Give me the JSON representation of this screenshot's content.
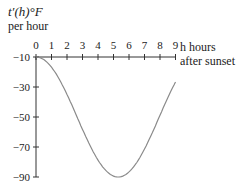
{
  "chart_data": {
    "type": "line",
    "title": "",
    "ylabel_line1": "t′(h)°F",
    "ylabel_line2": "per hour",
    "xlabel_line1": "h hours",
    "xlabel_line2": "after sunset",
    "x_ticks": [
      "0",
      "1",
      "2",
      "3",
      "4",
      "5",
      "6",
      "7",
      "8",
      "9"
    ],
    "y_ticks": [
      "−10",
      "−30",
      "−50",
      "−70",
      "−90"
    ],
    "xlim": [
      0,
      9
    ],
    "ylim": [
      -90,
      -10
    ],
    "series": [
      {
        "name": "t'(h)",
        "x": [
          0,
          1,
          2,
          3,
          4,
          5,
          5.3,
          6,
          7,
          8,
          9
        ],
        "values": [
          -10,
          -16.8,
          -35.4,
          -58.5,
          -79.2,
          -89.8,
          -90,
          -88.6,
          -77.1,
          -58.8,
          -26.5
        ]
      }
    ],
    "grid": false,
    "colors": {
      "axis": "#333333",
      "curve": "#8a8a8a"
    }
  }
}
